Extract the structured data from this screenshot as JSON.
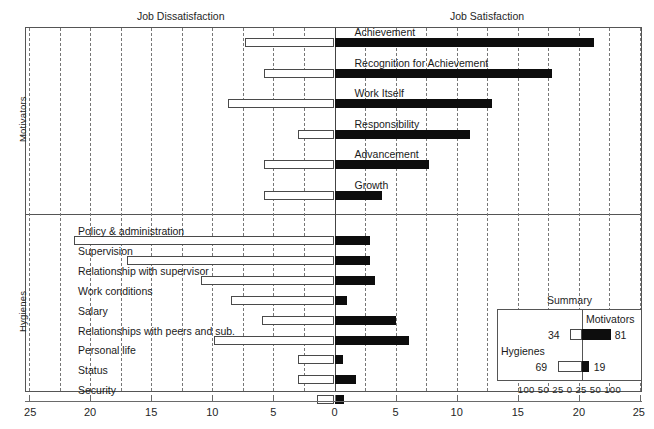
{
  "headers": {
    "left": "Job Dissatisfaction",
    "right": "Job Satisfaction"
  },
  "group_labels": {
    "motivators": "Motivators",
    "hygienes": "Hygienes"
  },
  "axis": {
    "ticks": [
      "25",
      "20",
      "15",
      "10",
      "5",
      "0",
      "5",
      "10",
      "15",
      "20",
      "25"
    ],
    "min": -25,
    "max": 25,
    "minor_step": 2.5
  },
  "summary": {
    "title": "Summary",
    "motivators_label": "Motivators",
    "hygienes_label": "Hygienes",
    "motivators_dissatisfaction": "34",
    "motivators_satisfaction": "81",
    "hygienes_dissatisfaction": "69",
    "hygienes_satisfaction": "19",
    "scale": "100 50 25  0  25 50 100"
  },
  "colors": {
    "satisfaction": "#0d0d0d",
    "dissatisfaction": "#ffffff",
    "border": "#4a4a4a",
    "frame": "#555555",
    "grid": "#777777"
  },
  "chart_data": {
    "type": "bar",
    "orientation": "horizontal",
    "xlabel": "Percentage frequency",
    "ylabel": "",
    "xlim": [
      -25,
      25
    ],
    "grid": true,
    "legend": [
      "Job Dissatisfaction",
      "Job Satisfaction"
    ],
    "legend_position": "top",
    "series": [
      {
        "name": "Job Dissatisfaction",
        "color": "#ffffff"
      },
      {
        "name": "Job Satisfaction",
        "color": "#0d0d0d"
      }
    ],
    "groups": [
      {
        "name": "Motivators",
        "categories": [
          "Achievement",
          "Recognition for Achievement",
          "Work Itself",
          "Responsibility",
          "Advancement",
          "Growth"
        ],
        "dissatisfaction": [
          7.3,
          5.8,
          8.7,
          3.0,
          5.8,
          5.8
        ],
        "satisfaction": [
          21.2,
          17.8,
          12.9,
          11.1,
          7.7,
          3.9
        ]
      },
      {
        "name": "Hygienes",
        "categories": [
          "Policy & administration",
          "Supervision",
          "Relationship with supervisor",
          "Work conditions",
          "Salary",
          "Relationships with peers and sub.",
          "Personal life",
          "Status",
          "Security"
        ],
        "dissatisfaction": [
          21.3,
          17.0,
          10.9,
          8.5,
          5.9,
          9.9,
          3.0,
          3.0,
          1.4
        ],
        "satisfaction": [
          2.9,
          2.9,
          3.3,
          1.0,
          5.0,
          6.1,
          0.7,
          1.8,
          0.8
        ]
      }
    ],
    "summary": {
      "type": "bar",
      "categories": [
        "Motivators",
        "Hygienes"
      ],
      "dissatisfaction": [
        34,
        69
      ],
      "satisfaction": [
        81,
        19
      ],
      "scale_ticks": [
        "100",
        "50",
        "25",
        "0",
        "25",
        "50",
        "100"
      ]
    }
  }
}
